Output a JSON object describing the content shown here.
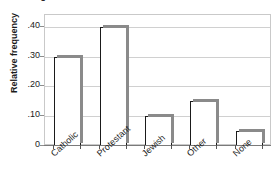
{
  "figure": {
    "background_color": "#ffffff",
    "frame_color": "#c9c9c9",
    "gridline_color": "#d0d0d0",
    "bar_fill_color": "#ffffff",
    "bar_outline_color": "#1a1a1a",
    "bar_shadow_color": "#8a8a8a",
    "clipped_title": "Religious affiliation"
  },
  "chart_data": {
    "type": "bar",
    "title": "",
    "xlabel": "",
    "ylabel": "Relative frequency",
    "categories": [
      "Catholic",
      "Protestant",
      "Jewish",
      "Other",
      "None"
    ],
    "values": [
      0.3,
      0.4,
      0.1,
      0.15,
      0.05
    ],
    "ylim": [
      0,
      0.44
    ],
    "ytick_values": [
      0,
      0.1,
      0.2,
      0.3,
      0.4
    ],
    "ytick_labels": [
      "0",
      ".10",
      ".20",
      ".30",
      ".40"
    ],
    "grid": true,
    "grid_axis": "y",
    "legend": null,
    "xtick_label_rotation": -42,
    "bar_style": "3d-shadow"
  }
}
